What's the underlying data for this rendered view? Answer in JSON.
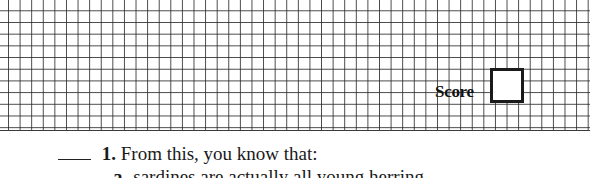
{
  "worksheet": {
    "score": {
      "label": "Score",
      "value": ""
    },
    "question": {
      "number": "1.",
      "text": "From this, you know that:",
      "answer_blank": "",
      "options": [
        {
          "letter": "a.",
          "text": "sardines are actually all young herring."
        }
      ]
    }
  },
  "colors": {
    "grid_line": "#333333",
    "background": "#ffffff",
    "text": "#1a1a1a"
  }
}
